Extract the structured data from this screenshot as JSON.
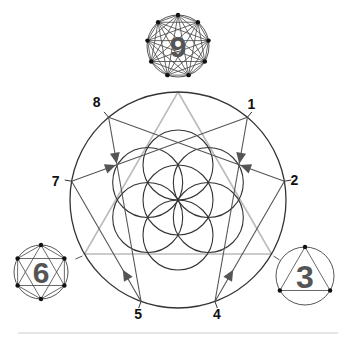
{
  "diagram": {
    "point_labels": [
      "1",
      "2",
      "3",
      "4",
      "5",
      "6",
      "7",
      "8",
      "9"
    ],
    "satellite_numbers": [
      {
        "id": "nine",
        "label": "9",
        "figure": "nonagon-complete-graph"
      },
      {
        "id": "six",
        "label": "6",
        "figure": "hexagram-in-circle"
      },
      {
        "id": "three",
        "label": "3",
        "figure": "triangle-in-circle"
      }
    ],
    "hexad_sequence": [
      "1",
      "4",
      "2",
      "8",
      "5",
      "7",
      "1"
    ],
    "triangle_points": [
      "3",
      "6",
      "9"
    ],
    "central_figure": "seed-of-life",
    "colors": {
      "line": "#333333",
      "triangle": "#bbbbbb",
      "number": "#555555",
      "label": "#111111",
      "separator": "#cccccc"
    }
  }
}
